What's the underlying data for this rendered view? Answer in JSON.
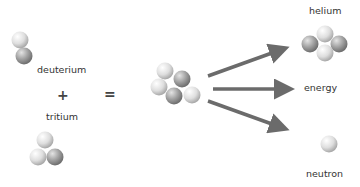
{
  "diagram": {
    "labels": {
      "deuterium": "deuterium",
      "tritium": "tritium",
      "helium": "helium",
      "energy": "energy",
      "neutron": "neutron"
    },
    "operators": {
      "plus": "+",
      "equals": "="
    },
    "colors": {
      "proton": "#a8a8a8",
      "neutron": "#e6e6e6",
      "arrow": "#6b6b6b",
      "text": "#333333"
    },
    "reactants": [
      "deuterium",
      "tritium"
    ],
    "products": [
      "helium",
      "energy",
      "neutron"
    ]
  }
}
